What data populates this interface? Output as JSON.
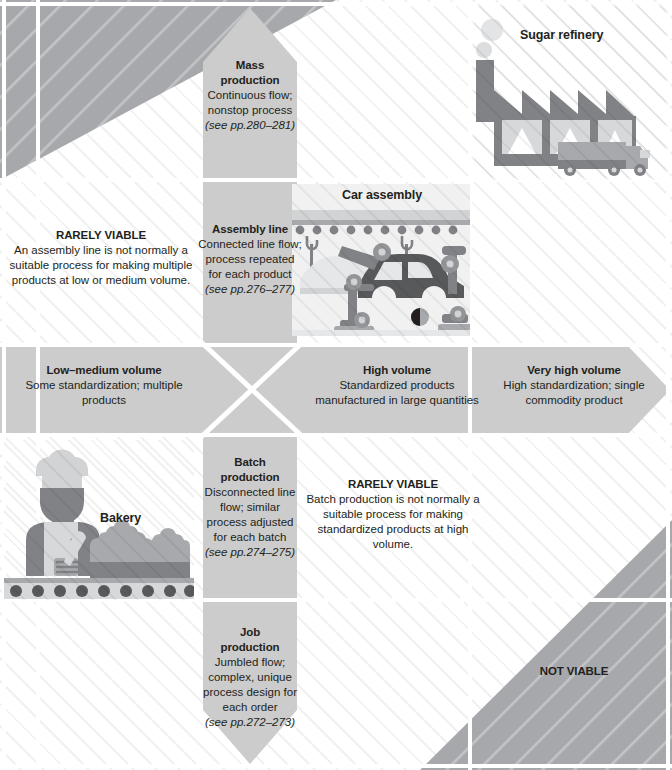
{
  "diagram": {
    "colors": {
      "band": "#cccccc",
      "nonviable": "#a6a8ab",
      "ink": "#231f20",
      "grid": "#ffffff",
      "illustration_dark": "#808285",
      "illustration_mid": "#a7a9ac",
      "illustration_light": "#d1d3d4"
    }
  },
  "illustrations": [
    {
      "id": "refinery",
      "title": "Sugar refinery"
    },
    {
      "id": "car",
      "title": "Car assembly"
    },
    {
      "id": "bakery",
      "title": "Bakery"
    }
  ],
  "process_band": {
    "steps": [
      {
        "id": "mass",
        "heading_line1": "Mass",
        "heading_line2": "production",
        "body": "Continuous flow; nonstop process",
        "source": "(see pp.280–281)"
      },
      {
        "id": "assembly",
        "heading_line1": "Assembly line",
        "heading_line2": "",
        "body": "Connected line flow; process repeated for each product",
        "source": "(see pp.276–277)"
      },
      {
        "id": "batch",
        "heading_line1": "Batch",
        "heading_line2": "production",
        "body": "Disconnected line flow; similar process adjusted for each batch",
        "source": "(see pp.274–275)"
      },
      {
        "id": "job",
        "heading_line1": "Job",
        "heading_line2": "production",
        "body": "Jumbled flow; complex, unique process design for each order",
        "source": "(see pp.272–273)"
      }
    ]
  },
  "volume_band": {
    "levels": [
      {
        "id": "low-medium",
        "heading": "Low–medium volume",
        "body": "Some standardization; multiple products"
      },
      {
        "id": "high",
        "heading": "High volume",
        "body": "Standardized products manufactured in large quantities"
      },
      {
        "id": "very-high",
        "heading": "Very high volume",
        "body": "High standardization; single commodity product"
      }
    ]
  },
  "viability_notes": [
    {
      "id": "rarely-viable-assembly",
      "heading": "RARELY VIABLE",
      "body": "An assembly line is not normally a suitable process for making multiple products at low or medium volume."
    },
    {
      "id": "rarely-viable-batch",
      "heading": "RARELY VIABLE",
      "body": "Batch production is not normally a suitable process for making standardized products at high volume."
    },
    {
      "id": "not-viable",
      "heading": "NOT VIABLE",
      "body": ""
    }
  ]
}
